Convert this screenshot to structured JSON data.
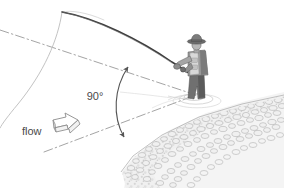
{
  "figure": {
    "title": "",
    "background_color": "#ffffff",
    "width": 284,
    "height": 188
  },
  "annotations": {
    "angle_label": "90°",
    "flow_label": "flow"
  },
  "colors": {
    "rod": "#3c3c3c",
    "fishing_line": "#b9b9b9",
    "axis_line": "#9a9a9a",
    "angle_arc": "#555555",
    "flow_arrow_stroke": "#8a8a8a",
    "flow_arrow_fill": "#ffffff",
    "angler_dark": "#555555",
    "angler_mid": "#8c8c8c",
    "angler_light": "#c4c4c4",
    "bank_stroke": "#9e9e9e",
    "bank_fill": "#e8e8e8",
    "water_ripple": "#c9c9c9",
    "text": "#4a4a4a"
  },
  "elements": {
    "rod_name": "fishing-rod",
    "line_name": "fishing-line",
    "upstream_axis_name": "upstream-reference-line",
    "downstream_axis_name": "downstream-reference-line",
    "angle_arc_name": "ninety-degree-arc",
    "flow_arrow_name": "flow-direction-arrow",
    "angler_name": "angler-figure",
    "bank_name": "gravel-riverbank",
    "ripple_name": "water-ripples"
  },
  "geometry": {
    "upper_axis": {
      "x1": 0,
      "y1": 30,
      "x2": 196,
      "y2": 95
    },
    "lower_axis": {
      "x1": 44,
      "y1": 152,
      "x2": 196,
      "y2": 95
    },
    "angle_arc_start": {
      "x": 128,
      "y": 67
    },
    "angle_arc_end": {
      "x": 124,
      "y": 137
    },
    "angle_value_degrees": 90,
    "angle_label_pos": {
      "x": 95,
      "y": 100
    },
    "flow_label_pos": {
      "x": 22,
      "y": 135
    },
    "flow_arrow_pos": {
      "x": 50,
      "y": 121
    },
    "angler_pos": {
      "x": 186,
      "y": 42
    },
    "rod_tip": {
      "x": 62,
      "y": 11
    },
    "rod_butt": {
      "x": 190,
      "y": 74
    }
  }
}
